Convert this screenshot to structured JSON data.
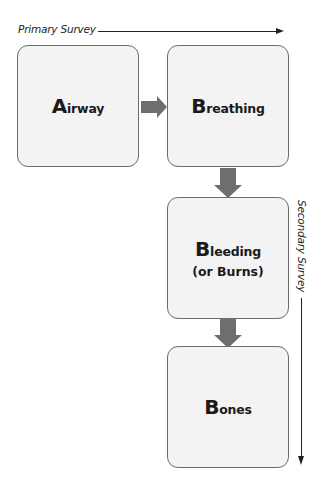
{
  "primary_survey": {
    "label": "Primary Survey"
  },
  "secondary_survey": {
    "label": "Secondary Survey"
  },
  "steps": [
    {
      "initial": "A",
      "rest": "irway",
      "sub": ""
    },
    {
      "initial": "B",
      "rest": "reathing",
      "sub": ""
    },
    {
      "initial": "B",
      "rest": "leeding",
      "sub": "(or Burns)"
    },
    {
      "initial": "B",
      "rest": "ones",
      "sub": ""
    }
  ],
  "colors": {
    "box_fill": "#f3f3f3",
    "box_border": "#6b6b6b",
    "arrow_fill": "#6e6e6e",
    "text": "#1a1a1a"
  }
}
